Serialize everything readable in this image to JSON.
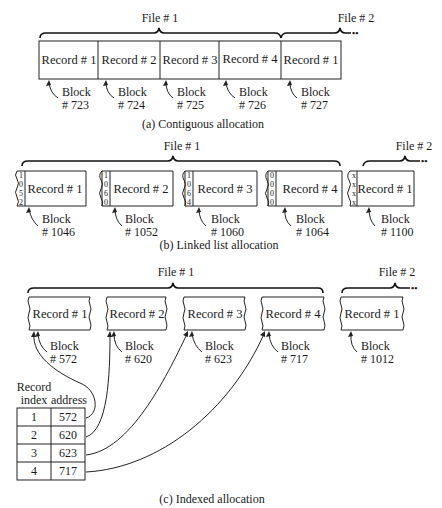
{
  "contiguous": {
    "file1_label": "File # 1",
    "file2_label": "File # 2",
    "records": [
      {
        "label": "Record # 1",
        "block": "Block",
        "num": "# 723"
      },
      {
        "label": "Record # 2",
        "block": "Block",
        "num": "# 724"
      },
      {
        "label": "Record # 3",
        "block": "Block",
        "num": "# 725"
      },
      {
        "label": "Record # 4",
        "block": "Block",
        "num": "# 726"
      },
      {
        "label": "Record # 1",
        "block": "Block",
        "num": "# 727"
      }
    ],
    "caption": "(a) Contiguous allocation"
  },
  "linked": {
    "file1_label": "File # 1",
    "file2_label": "File # 2",
    "records": [
      {
        "label": "Record # 1",
        "pointer": [
          "1",
          "0",
          "5",
          "2"
        ],
        "block": "Block",
        "num": "# 1046"
      },
      {
        "label": "Record # 2",
        "pointer": [
          "1",
          "0",
          "6",
          "0"
        ],
        "block": "Block",
        "num": "# 1052"
      },
      {
        "label": "Record # 3",
        "pointer": [
          "1",
          "0",
          "6",
          "4"
        ],
        "block": "Block",
        "num": "# 1060"
      },
      {
        "label": "Record # 4",
        "pointer": [
          "0",
          "0",
          "0",
          "0"
        ],
        "block": "Block",
        "num": "# 1064"
      },
      {
        "label": "Record # 1",
        "pointer": [
          "x",
          "x",
          "x",
          "x"
        ],
        "block": "Block",
        "num": "# 1100"
      }
    ],
    "caption": "(b) Linked list allocation"
  },
  "indexed": {
    "file1_label": "File # 1",
    "file2_label": "File # 2",
    "records": [
      {
        "label": "Record # 1",
        "block": "Block",
        "num": "# 572"
      },
      {
        "label": "Record # 2",
        "block": "Block",
        "num": "# 620"
      },
      {
        "label": "Record # 3",
        "block": "Block",
        "num": "# 623"
      },
      {
        "label": "Record # 4",
        "block": "Block",
        "num": "# 717"
      },
      {
        "label": "Record # 1",
        "block": "Block",
        "num": "# 1012"
      }
    ],
    "table": {
      "header_line1": "Record",
      "header_col1": "index",
      "header_col2": "address",
      "rows": [
        {
          "index": "1",
          "address": "572"
        },
        {
          "index": "2",
          "address": "620"
        },
        {
          "index": "3",
          "address": "623"
        },
        {
          "index": "4",
          "address": "717"
        }
      ]
    },
    "caption": "(c) Indexed allocation"
  },
  "continuation_marker": "••"
}
